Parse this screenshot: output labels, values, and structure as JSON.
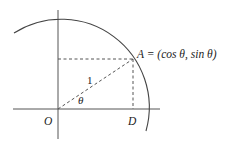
{
  "diagram": {
    "colors": {
      "stroke": "#4a4a4a",
      "text": "#222222",
      "background": "#ffffff"
    },
    "labels": {
      "point_A": "A = (cos θ, sin θ)",
      "origin": "O",
      "foot": "D",
      "radius": "1",
      "angle": "θ"
    },
    "elements": {
      "axes": [
        "horizontal axis",
        "vertical axis"
      ],
      "arc": "unit circle arc",
      "dashed_lines": [
        "OA (radius)",
        "A to vertical axis",
        "A to D"
      ]
    }
  }
}
